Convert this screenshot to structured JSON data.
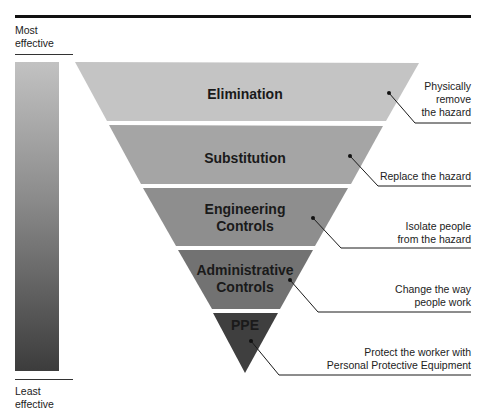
{
  "scale": {
    "top_label_line1": "Most",
    "top_label_line2": "effective",
    "bottom_label_line1": "Least",
    "bottom_label_line2": "effective"
  },
  "tiers": [
    {
      "name": "Elimination",
      "line1": "Elimination",
      "line2": "",
      "fill": "#c4c4c4",
      "description_line1": "Physically",
      "description_line2": "remove",
      "description_line3": "the hazard"
    },
    {
      "name": "Substitution",
      "line1": "Substitution",
      "line2": "",
      "fill": "#a5a5a5",
      "description_line1": "Replace the hazard",
      "description_line2": "",
      "description_line3": ""
    },
    {
      "name": "Engineering Controls",
      "line1": "Engineering",
      "line2": "Controls",
      "fill": "#8e8e8e",
      "description_line1": "Isolate people",
      "description_line2": "from the hazard",
      "description_line3": ""
    },
    {
      "name": "Administrative Controls",
      "line1": "Administrative",
      "line2": "Controls",
      "fill": "#727272",
      "description_line1": "Change the way",
      "description_line2": "people work",
      "description_line3": ""
    },
    {
      "name": "PPE",
      "line1": "PPE",
      "line2": "",
      "fill": "#3f3f3f",
      "description_line1": "Protect the worker with",
      "description_line2": "Personal Protective Equipment",
      "description_line3": ""
    }
  ],
  "colors": {
    "rule": "#111111",
    "leader": "#1a1a1a",
    "gradient_top": "#c2c2c2",
    "gradient_bottom": "#3c3c3c"
  }
}
